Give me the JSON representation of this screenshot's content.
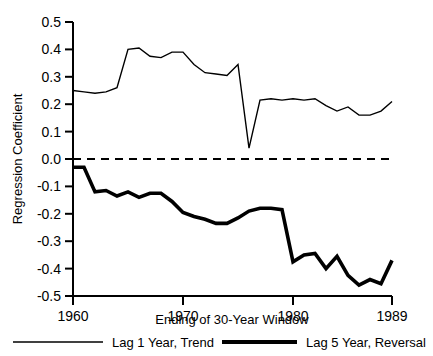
{
  "chart_data": {
    "type": "line",
    "title": "",
    "xlabel": "Ending of 30-Year Window",
    "ylabel": "Regression Coefficient",
    "xlim": [
      1960,
      1989
    ],
    "ylim": [
      -0.5,
      0.5
    ],
    "grid": false,
    "legend_position": "bottom",
    "xticks": [
      1960,
      1970,
      1980,
      1989
    ],
    "xtick_labels": [
      "1960",
      "1970",
      "1980",
      "1989"
    ],
    "yticks": [
      0.5,
      0.4,
      0.3,
      0.2,
      0.1,
      0.0,
      -0.1,
      -0.2,
      -0.3,
      -0.4,
      -0.5
    ],
    "ytick_labels": [
      "0.5",
      "0.4",
      "0.3",
      "0.2",
      "0.1",
      "0.0",
      "-0.1",
      "-0.2",
      "-0.3",
      "-0.4",
      "-0.5"
    ],
    "annotations": [
      {
        "name": "zero-reference-line",
        "type": "hline",
        "y": 0.0,
        "style": "dashed"
      }
    ],
    "x": [
      1960,
      1961,
      1962,
      1963,
      1964,
      1965,
      1966,
      1967,
      1968,
      1969,
      1970,
      1971,
      1972,
      1973,
      1974,
      1975,
      1976,
      1977,
      1978,
      1979,
      1980,
      1981,
      1982,
      1983,
      1984,
      1985,
      1986,
      1987,
      1988,
      1989
    ],
    "series": [
      {
        "name": "Lag 1 Year, Trend",
        "style": "thin",
        "color": "#000000",
        "values": [
          0.25,
          0.245,
          0.24,
          0.245,
          0.26,
          0.4,
          0.405,
          0.375,
          0.37,
          0.39,
          0.39,
          0.345,
          0.315,
          0.31,
          0.305,
          0.345,
          0.04,
          0.215,
          0.22,
          0.215,
          0.22,
          0.215,
          0.22,
          0.195,
          0.175,
          0.19,
          0.16,
          0.16,
          0.175,
          0.21
        ]
      },
      {
        "name": "Lag 5 Year, Reversal",
        "style": "thick",
        "color": "#000000",
        "values": [
          -0.03,
          -0.03,
          -0.12,
          -0.115,
          -0.135,
          -0.12,
          -0.14,
          -0.125,
          -0.125,
          -0.155,
          -0.195,
          -0.21,
          -0.22,
          -0.235,
          -0.235,
          -0.215,
          -0.19,
          -0.18,
          -0.18,
          -0.185,
          -0.375,
          -0.35,
          -0.345,
          -0.4,
          -0.355,
          -0.425,
          -0.46,
          -0.44,
          -0.455,
          -0.37
        ]
      }
    ]
  },
  "legend": {
    "items": [
      {
        "label": "Lag 1 Year, Trend",
        "style": "thin"
      },
      {
        "label": "Lag 5 Year, Reversal",
        "style": "thick"
      }
    ]
  }
}
